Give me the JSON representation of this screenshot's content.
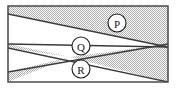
{
  "figure": {
    "frame": {
      "x": 8,
      "y": 6,
      "width": 160,
      "height": 76,
      "border_color": "#4a4a4a",
      "border_width": 1.5
    },
    "colors": {
      "shade_fill": "#c9c9c9",
      "shade_pattern": "checker-dither",
      "unshaded_fill": "#ffffff",
      "line_color": "#3a3a3a",
      "label_text": "#1a1a1a",
      "background": "#ffffff"
    },
    "lines": [
      {
        "name": "line-top-diagonal",
        "x1": 8,
        "y1": 14,
        "x2": 168,
        "y2": 47
      },
      {
        "name": "line-mid-diagonal",
        "x1": 8,
        "y1": 44,
        "x2": 168,
        "y2": 47
      },
      {
        "name": "line-lower-upward",
        "x1": 8,
        "y1": 72,
        "x2": 168,
        "y2": 44
      },
      {
        "name": "line-lower-downward",
        "x1": 8,
        "y1": 48,
        "x2": 168,
        "y2": 82
      }
    ],
    "shaded_polygons": [
      {
        "name": "shade-top-band",
        "points": "8,6 168,6 168,47 8,14"
      },
      {
        "name": "shade-left-wedge",
        "points": "8,44 8,48 70,57"
      },
      {
        "name": "shade-lower-left",
        "points": "8,72 8,82 70,57"
      },
      {
        "name": "shade-right-wedge",
        "points": "168,44 168,82 70,57"
      }
    ],
    "labels": [
      {
        "name": "region-label-p",
        "text": "P",
        "cx": 117,
        "cy": 23,
        "r": 9
      },
      {
        "name": "region-label-q",
        "text": "Q",
        "cx": 81,
        "cy": 46,
        "r": 9
      },
      {
        "name": "region-label-r",
        "text": "R",
        "cx": 81,
        "cy": 69,
        "r": 9
      }
    ]
  }
}
